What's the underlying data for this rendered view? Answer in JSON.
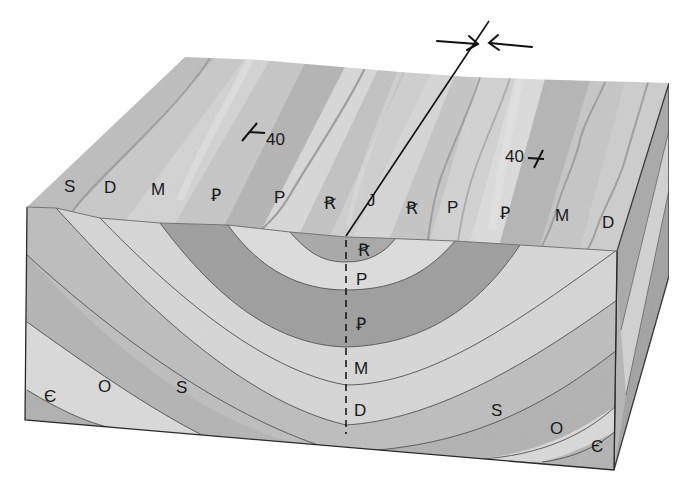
{
  "figure": {
    "type": "geologic block diagram"
  },
  "colors": {
    "background": "#ffffff",
    "outline": "#2a2a2a",
    "light_band": "#dcdcdc",
    "mid_band": "#b9b9b9",
    "dark_band": "#9c9c9c",
    "surface": "#c4c4c4"
  },
  "surface_labels": [
    {
      "text": "S",
      "x": 64,
      "y": 192
    },
    {
      "text": "D",
      "x": 104,
      "y": 193
    },
    {
      "text": "M",
      "x": 151,
      "y": 195
    },
    {
      "text": "Ꝑ",
      "x": 211,
      "y": 201
    },
    {
      "text": "P",
      "x": 274,
      "y": 203
    },
    {
      "text": "Ꞧ",
      "x": 324,
      "y": 209
    },
    {
      "text": "J",
      "x": 367,
      "y": 206
    },
    {
      "text": "Ꞧ",
      "x": 406,
      "y": 214
    },
    {
      "text": "P",
      "x": 447,
      "y": 213
    },
    {
      "text": "Ꝑ",
      "x": 500,
      "y": 219
    },
    {
      "text": "M",
      "x": 555,
      "y": 221
    },
    {
      "text": "D",
      "x": 602,
      "y": 228
    }
  ],
  "section_labels": [
    {
      "text": "Ꞧ",
      "x": 358,
      "y": 256
    },
    {
      "text": "P",
      "x": 356,
      "y": 285
    },
    {
      "text": "Ꝑ",
      "x": 356,
      "y": 330
    },
    {
      "text": "M",
      "x": 354,
      "y": 374
    },
    {
      "text": "D",
      "x": 354,
      "y": 416
    },
    {
      "text": "Є",
      "x": 44,
      "y": 402
    },
    {
      "text": "O",
      "x": 98,
      "y": 392
    },
    {
      "text": "S",
      "x": 176,
      "y": 393
    },
    {
      "text": "S",
      "x": 491,
      "y": 416
    },
    {
      "text": "O",
      "x": 550,
      "y": 434
    },
    {
      "text": "Є",
      "x": 591,
      "y": 452
    }
  ],
  "strike_dip": [
    {
      "dip": "40",
      "x": 266,
      "y": 145
    },
    {
      "dip": "40",
      "x": 505,
      "y": 162
    }
  ],
  "fold_axis": {
    "label": "axial plane",
    "compression": "opposing arrows"
  }
}
